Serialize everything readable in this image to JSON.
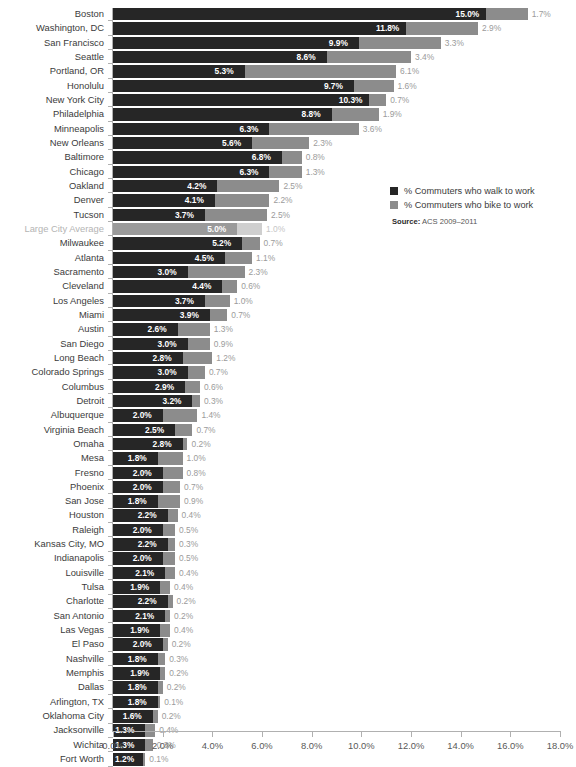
{
  "chart_data": {
    "type": "bar",
    "orientation": "horizontal",
    "stacked": true,
    "title": "",
    "xlabel": "",
    "ylabel": "",
    "xlim": [
      0,
      18
    ],
    "xtick_labels": [
      "0.0%",
      "2.0%",
      "4.0%",
      "6.0%",
      "8.0%",
      "10.0%",
      "12.0%",
      "14.0%",
      "16.0%",
      "18.0%"
    ],
    "xtick_values": [
      0,
      2,
      4,
      6,
      8,
      10,
      12,
      14,
      16,
      18
    ],
    "grid": false,
    "legend_position": "right",
    "categories": [
      "Boston",
      "Washington, DC",
      "San Francisco",
      "Seattle",
      "Portland, OR",
      "Honolulu",
      "New York City",
      "Philadelphia",
      "Minneapolis",
      "New Orleans",
      "Baltimore",
      "Chicago",
      "Oakland",
      "Denver",
      "Tucson",
      "Large City Average",
      "Milwaukee",
      "Atlanta",
      "Sacramento",
      "Cleveland",
      "Los Angeles",
      "Miami",
      "Austin",
      "San Diego",
      "Long Beach",
      "Colorado Springs",
      "Columbus",
      "Detroit",
      "Albuquerque",
      "Virginia Beach",
      "Omaha",
      "Mesa",
      "Fresno",
      "Phoenix",
      "San Jose",
      "Houston",
      "Raleigh",
      "Kansas City, MO",
      "Indianapolis",
      "Louisville",
      "Tulsa",
      "Charlotte",
      "San Antonio",
      "Las Vegas",
      "El Paso",
      "Nashville",
      "Memphis",
      "Dallas",
      "Arlington, TX",
      "Oklahoma City",
      "Jacksonville",
      "Wichita",
      "Fort Worth"
    ],
    "series": [
      {
        "name": "% Commuters who walk to work",
        "color": "#262626",
        "values": [
          15.0,
          11.8,
          9.9,
          8.6,
          5.3,
          9.7,
          10.3,
          8.8,
          6.3,
          5.6,
          6.8,
          6.3,
          4.2,
          4.1,
          3.7,
          5.0,
          5.2,
          4.5,
          3.0,
          4.4,
          3.7,
          3.9,
          2.6,
          3.0,
          2.8,
          3.0,
          2.9,
          3.2,
          2.0,
          2.5,
          2.8,
          1.8,
          2.0,
          2.0,
          1.8,
          2.2,
          2.0,
          2.2,
          2.0,
          2.1,
          1.9,
          2.2,
          2.1,
          1.9,
          2.0,
          1.8,
          1.9,
          1.8,
          1.8,
          1.6,
          1.3,
          1.3,
          1.2
        ],
        "labels": [
          "15.0%",
          "11.8%",
          "9.9%",
          "8.6%",
          "5.3%",
          "9.7%",
          "10.3%",
          "8.8%",
          "6.3%",
          "5.6%",
          "6.8%",
          "6.3%",
          "4.2%",
          "4.1%",
          "3.7%",
          "5.0%",
          "5.2%",
          "4.5%",
          "3.0%",
          "4.4%",
          "3.7%",
          "3.9%",
          "2.6%",
          "3.0%",
          "2.8%",
          "3.0%",
          "2.9%",
          "3.2%",
          "2.0%",
          "2.5%",
          "2.8%",
          "1.8%",
          "2.0%",
          "2.0%",
          "1.8%",
          "2.2%",
          "2.0%",
          "2.2%",
          "2.0%",
          "2.1%",
          "1.9%",
          "2.2%",
          "2.1%",
          "1.9%",
          "2.0%",
          "1.8%",
          "1.9%",
          "1.8%",
          "1.8%",
          "1.6%",
          "1.3%",
          "1.3%",
          "1.2%"
        ]
      },
      {
        "name": "% Commuters who bike to work",
        "color": "#8c8c8c",
        "values": [
          1.7,
          2.9,
          3.3,
          3.4,
          6.1,
          1.6,
          0.7,
          1.9,
          3.6,
          2.3,
          0.8,
          1.3,
          2.5,
          2.2,
          2.5,
          1.0,
          0.7,
          1.1,
          2.3,
          0.6,
          1.0,
          0.7,
          1.3,
          0.9,
          1.2,
          0.7,
          0.6,
          0.3,
          1.4,
          0.7,
          0.2,
          1.0,
          0.8,
          0.7,
          0.9,
          0.4,
          0.5,
          0.3,
          0.5,
          0.4,
          0.4,
          0.2,
          0.2,
          0.4,
          0.2,
          0.3,
          0.2,
          0.2,
          0.1,
          0.2,
          0.4,
          0.3,
          0.1
        ],
        "labels": [
          "1.7%",
          "2.9%",
          "3.3%",
          "3.4%",
          "6.1%",
          "1.6%",
          "0.7%",
          "1.9%",
          "3.6%",
          "2.3%",
          "0.8%",
          "1.3%",
          "2.5%",
          "2.2%",
          "2.5%",
          "1.0%",
          "0.7%",
          "1.1%",
          "2.3%",
          "0.6%",
          "1.0%",
          "0.7%",
          "1.3%",
          "0.9%",
          "1.2%",
          "0.7%",
          "0.6%",
          "0.3%",
          "1.4%",
          "0.7%",
          "0.2%",
          "1.0%",
          "0.8%",
          "0.7%",
          "0.9%",
          "0.4%",
          "0.5%",
          "0.3%",
          "0.5%",
          "0.4%",
          "0.4%",
          "0.2%",
          "0.2%",
          "0.4%",
          "0.2%",
          "0.3%",
          "0.2%",
          "0.2%",
          "0.1%",
          "0.2%",
          "0.4%",
          "0.3%",
          "0.1%"
        ]
      }
    ],
    "highlight_category": "Large City Average",
    "highlight_colors": {
      "walk": "#9a9a9a",
      "bike": "#cfcfcf"
    }
  },
  "legend": {
    "items": [
      {
        "label": "% Commuters who walk to work",
        "color": "#262626"
      },
      {
        "label": "% Commuters who bike to work",
        "color": "#8c8c8c"
      }
    ]
  },
  "source": {
    "label": "Source:",
    "text": " ACS 2009–2011"
  },
  "title_remnant": ""
}
